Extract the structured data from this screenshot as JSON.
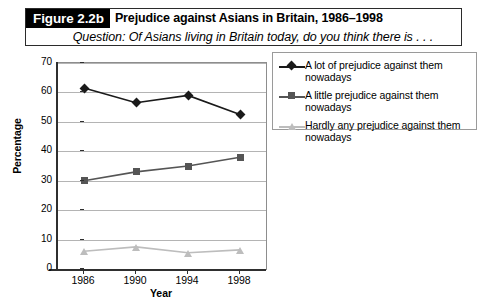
{
  "caption": {
    "figure_tag": "Figure 2.2b",
    "title": "Prejudice against Asians in Britain, 1986–1998",
    "question": "Question: Of Asians living in Britain today, do you think there is . . ."
  },
  "chart_data": {
    "type": "line",
    "title": "Prejudice against Asians in Britain, 1986–1998",
    "subtitle": "Question: Of Asians living in Britain today, do you think there is . . .",
    "xlabel": "Year",
    "ylabel": "Percentage",
    "categories": [
      "1986",
      "1990",
      "1994",
      "1998"
    ],
    "ylim": [
      0,
      70
    ],
    "yticks": [
      0,
      10,
      20,
      30,
      40,
      50,
      60,
      70
    ],
    "grid": true,
    "legend_position": "right",
    "series": [
      {
        "name": "A lot of prejudice against them nowadays",
        "values": [
          61.5,
          56.5,
          59,
          52.5
        ],
        "color": "#1a1a1a",
        "marker": "diamond"
      },
      {
        "name": "A little prejudice against them nowadays",
        "values": [
          30,
          33,
          35,
          38
        ],
        "color": "#555555",
        "marker": "square"
      },
      {
        "name": "Hardly any prejudice against them nowadays",
        "values": [
          6,
          7.5,
          5.5,
          6.5
        ],
        "color": "#bdbdbd",
        "marker": "triangle"
      }
    ]
  }
}
